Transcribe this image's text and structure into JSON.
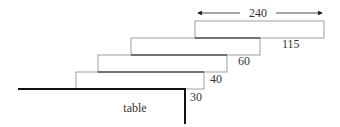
{
  "diagram": {
    "width_label": "240",
    "overhang_labels": [
      "115",
      "60",
      "40",
      "30"
    ],
    "table_label": "table",
    "colors": {
      "block_stroke": "#888888",
      "table_stroke": "#111111",
      "text": "#333333"
    }
  }
}
